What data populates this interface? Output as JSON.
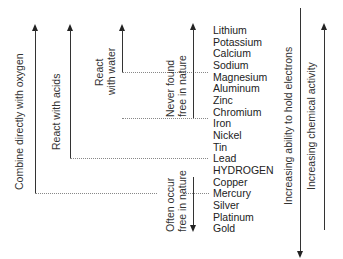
{
  "elements": [
    "Lithium",
    "Potassium",
    "Calcium",
    "Sodium",
    "Magnesium",
    "Aluminum",
    "Zinc",
    "Chromium",
    "Iron",
    "Nickel",
    "Tin",
    "Lead",
    "HYDROGEN",
    "Copper",
    "Mercury",
    "Silver",
    "Platinum",
    "Gold"
  ],
  "arrows": {
    "oxygen": {
      "label": "Combine directly with oxygen",
      "direction": "up",
      "ends_at": "Mercury"
    },
    "acids": {
      "label": "React with acids",
      "direction": "up",
      "ends_at": "Lead"
    },
    "water": {
      "label_line1": "React",
      "label_line2": "with water",
      "direction": "up",
      "ends_at": "Sodium"
    },
    "never_free": {
      "label_line1": "Never found",
      "label_line2": "free in nature",
      "direction": "up",
      "ends_at": "Chromium"
    },
    "often_free": {
      "label_line1": "Often occur",
      "label_line2": "free in nature",
      "direction": "down",
      "starts_at": "Mercury"
    },
    "hold_electrons": {
      "label": "Increasing ability to hold electrons",
      "direction": "down"
    },
    "chemical_activity": {
      "label": "Increasing chemical activity",
      "direction": "up"
    }
  },
  "colors": {
    "line": "#333333",
    "dotted": "#888888",
    "text": "#222222",
    "background": "#ffffff"
  }
}
